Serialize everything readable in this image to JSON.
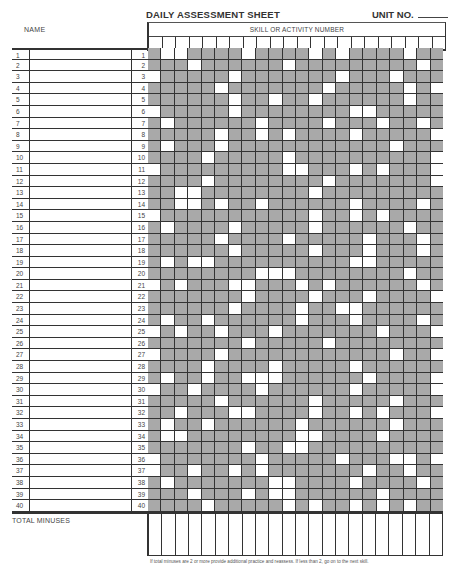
{
  "header": {
    "title": "DAILY ASSESSMENT SHEET",
    "unit_label": "UNIT NO.",
    "name_label": "NAME",
    "skill_header": "SKILL OR ACTIVITY NUMBER"
  },
  "grid": {
    "columns": 22,
    "rows": 40,
    "row_numbers": [
      "1",
      "2",
      "3",
      "4",
      "5",
      "6",
      "7",
      "8",
      "9",
      "10",
      "11",
      "12",
      "13",
      "14",
      "15",
      "16",
      "17",
      "18",
      "19",
      "20",
      "21",
      "22",
      "23",
      "24",
      "25",
      "26",
      "27",
      "28",
      "29",
      "30",
      "31",
      "32",
      "33",
      "34",
      "35",
      "36",
      "37",
      "38",
      "39",
      "40"
    ],
    "shading_note": "s = shaded cell, w = white cell, one string per row left-to-right",
    "shading": [
      "swwsssswsssswswsssswss",
      "ssswsssssswsssssssssws",
      "wssssswssssssswssswsss",
      "ssssswssssssswssssswsw",
      "sssssswsswsswsssssswss",
      "wssssswsssssssswwsssss",
      "swsssssswsssswssswssws",
      "ssssswsswswsssswsssssw",
      "swssswsssssssssssswsss",
      "sssswssssswssssssssssw",
      "wssssssssswwssswswsssw",
      "sssswsssssssswsssssssw",
      "sswwsssssssswssssssss",
      "sswwswsswsssssswssssws",
      "wssssssssssswsswswssss",
      "swsssswssssswsssssswss",
      "ssssswsssswssssswsssws",
      "sssssswssssswssswssswss",
      "swswwsssssssssswwsssssw",
      "sssssssswwwsssssssswsss",
      "wswssswwssswswssssssws",
      "ssssssswsssswssswssssw",
      "sssssswsssswsswwsssssss",
      "swsswsssssswssswsssswss",
      "wswsswssswssssssswsssw",
      "ssssssswssssswsssssss",
      "wsssswsssssssssssswssws",
      "sssswsssswssssswsssssss",
      "swsswsswwwsssssswssssws",
      "wsswsssswsssssswsssssw",
      "ssssswsssssswssssswsss",
      "sswssswwsssswsswswsssw",
      "swsswsssssswsssssswss",
      "swwsssssssswwsssswsss",
      "ssssssswsswwsssssssss",
      "wssssssswssssswssswwsw",
      "wsswsswswssssssswsswss",
      "swssssssswwsssswsssswss",
      "ssswssswswwsssssswssss",
      "sssswssssswswsswswswss"
    ]
  },
  "footer": {
    "total_label": "TOTAL MINUSES",
    "footnote": "If total minuses are 2 or more provide additional practice and reassess. If less than 2, go on to the next skill."
  },
  "colors": {
    "shaded": "#a9a9a9",
    "line": "#333333"
  }
}
